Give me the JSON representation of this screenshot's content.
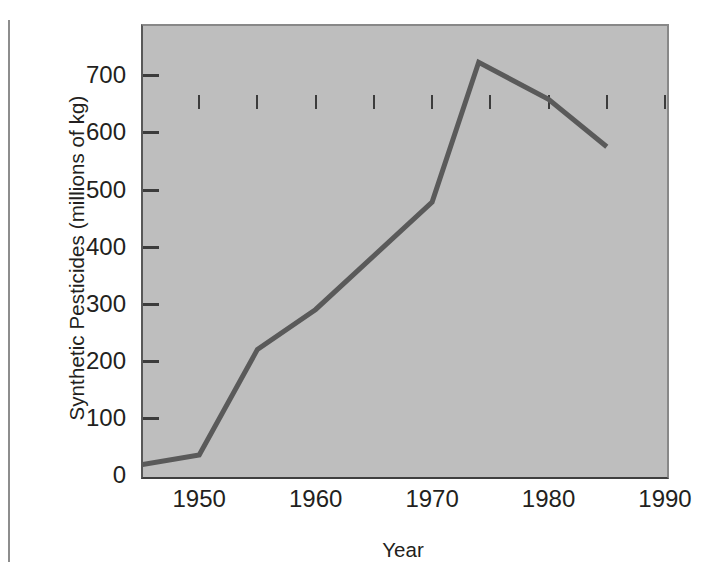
{
  "chart_data": {
    "type": "line",
    "title": "",
    "xlabel": "Year",
    "ylabel": "Synthetic Pesticides (millions of kg)",
    "xlim": [
      1945,
      1990
    ],
    "ylim": [
      0,
      790
    ],
    "grid": false,
    "legend": "none",
    "x_ticks": [
      1950,
      1960,
      1970,
      1980,
      1990
    ],
    "x_tick_labels": [
      "1950",
      "1960",
      "1970",
      "1980",
      "1990"
    ],
    "x_minor_ticks": [
      1945,
      1955,
      1965,
      1975,
      1985
    ],
    "y_ticks": [
      0,
      100,
      200,
      300,
      400,
      500,
      600,
      700
    ],
    "y_tick_labels": [
      "0",
      "100",
      "200",
      "300",
      "400",
      "500",
      "600",
      "700"
    ],
    "series": [
      {
        "name": "Synthetic pesticide production",
        "color": "#5a5a5a",
        "x": [
          1945,
          1950,
          1955,
          1960,
          1970,
          1974,
          1980,
          1985
        ],
        "values": [
          18,
          35,
          220,
          290,
          478,
          723,
          658,
          575
        ]
      }
    ],
    "plot_background": "#bebebe",
    "line_color": "#5a5a5a",
    "axis_color": "#3c3c3c",
    "text_color": "#231f20"
  },
  "axes": {
    "y_title": "Synthetic Pesticides (millions of kg)",
    "x_title": "Year"
  }
}
